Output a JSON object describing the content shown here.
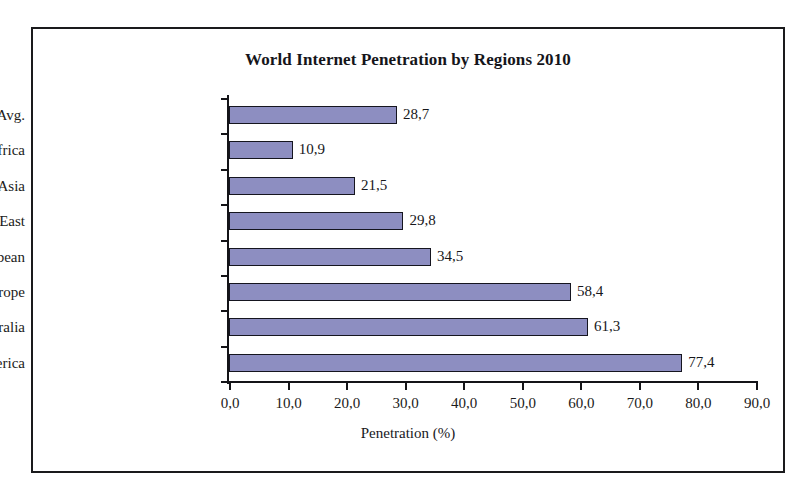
{
  "chart_data": {
    "type": "bar",
    "orientation": "horizontal",
    "title": "World Internet Penetration by Regions 2010",
    "xlabel": "Penetration (%)",
    "ylabel": "",
    "xlim": [
      0,
      90
    ],
    "xtick_step": 10,
    "grid": false,
    "legend": null,
    "decimal_separator": ",",
    "bar_color": "#8d8ec1",
    "bar_border_color": "#15151f",
    "categories": [
      "World, Avg.",
      "Africa",
      "Asia",
      "Middle East",
      "Latin America/Caribbean",
      "Europe",
      "Oceania/Australia",
      "North America"
    ],
    "values": [
      28.7,
      10.9,
      21.5,
      29.8,
      34.5,
      58.4,
      61.3,
      77.4
    ],
    "value_labels": [
      "28,7",
      "10,9",
      "21,5",
      "29,8",
      "34,5",
      "58,4",
      "61,3",
      "77,4"
    ],
    "xtick_labels": [
      "0,0",
      "10,0",
      "20,0",
      "30,0",
      "40,0",
      "50,0",
      "60,0",
      "70,0",
      "80,0",
      "90,0"
    ],
    "xtick_values": [
      0,
      10,
      20,
      30,
      40,
      50,
      60,
      70,
      80,
      90
    ]
  }
}
